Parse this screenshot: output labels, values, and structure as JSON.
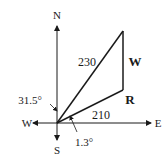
{
  "diagram": {
    "type": "vector-diagram",
    "compass": {
      "north": "N",
      "south": "S",
      "west": "W",
      "east": "E"
    },
    "vectors": {
      "resultant_magnitude": "230",
      "r_magnitude": "210",
      "r_label": "R",
      "w_label": "W"
    },
    "angles": {
      "from_north": "31.5°",
      "above_east": "1.3°"
    },
    "colors": {
      "stroke": "#1a1a1a",
      "background": "#ffffff"
    }
  }
}
